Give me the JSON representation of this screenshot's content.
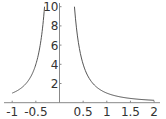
{
  "chart_data": {
    "type": "line",
    "title": "",
    "xlabel": "",
    "ylabel": "",
    "function": "1/x^2",
    "xlim": [
      -1,
      2
    ],
    "ylim": [
      0,
      10
    ],
    "grid": false,
    "legend": null,
    "x_ticks": [
      "-1",
      "-0.5",
      "0.5",
      "1",
      "1.5",
      "2"
    ],
    "x_tick_values": [
      -1,
      -0.5,
      0.5,
      1,
      1.5,
      2
    ],
    "y_ticks": [
      "2",
      "4",
      "6",
      "8",
      "10"
    ],
    "y_tick_values": [
      2,
      4,
      6,
      8,
      10
    ],
    "series": [
      {
        "name": "left branch",
        "x": [
          -1,
          -0.9,
          -0.8,
          -0.7,
          -0.6,
          -0.5,
          -0.45,
          -0.4,
          -0.35,
          -0.316
        ],
        "y": [
          1,
          1.23,
          1.56,
          2.04,
          2.78,
          4,
          4.94,
          6.25,
          8.16,
          10
        ]
      },
      {
        "name": "right branch",
        "x": [
          0.316,
          0.35,
          0.4,
          0.45,
          0.5,
          0.6,
          0.7,
          0.8,
          1,
          1.2,
          1.5,
          1.8,
          2
        ],
        "y": [
          10,
          8.16,
          6.25,
          4.94,
          4,
          2.78,
          2.04,
          1.56,
          1,
          0.69,
          0.44,
          0.31,
          0.25
        ]
      }
    ],
    "colors": {
      "curve": "#555555",
      "axis": "#888888",
      "text": "#333333"
    }
  }
}
